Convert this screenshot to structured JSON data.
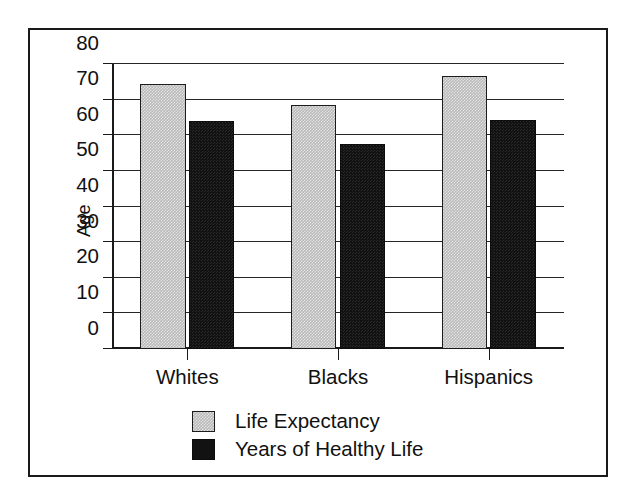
{
  "chart_data": {
    "type": "bar",
    "title": "",
    "subtitle": "",
    "xlabel": "",
    "ylabel": "Age",
    "categories": [
      "Whites",
      "Blacks",
      "Hispanics"
    ],
    "series": [
      {
        "name": "Life Expectancy",
        "color": "#b9b9b9",
        "values": [
          74.5,
          68.5,
          76.5
        ]
      },
      {
        "name": "Years of Healthy Life",
        "color": "#121212",
        "values": [
          64.0,
          57.5,
          64.3
        ]
      }
    ],
    "ylim": [
      0,
      80
    ],
    "ytick_labels": [
      "80",
      "70",
      "60",
      "50",
      "40",
      "30",
      "20",
      "10",
      "0"
    ],
    "ytick_values": [
      80,
      70,
      60,
      50,
      40,
      30,
      20,
      10,
      0
    ],
    "grid": true,
    "grid_axis": "y",
    "legend_position": "bottom-center",
    "legend": [
      "Life Expectancy",
      "Years of Healthy Life"
    ],
    "annotations": []
  },
  "frame": {
    "border_color": "#1a1a1a"
  }
}
